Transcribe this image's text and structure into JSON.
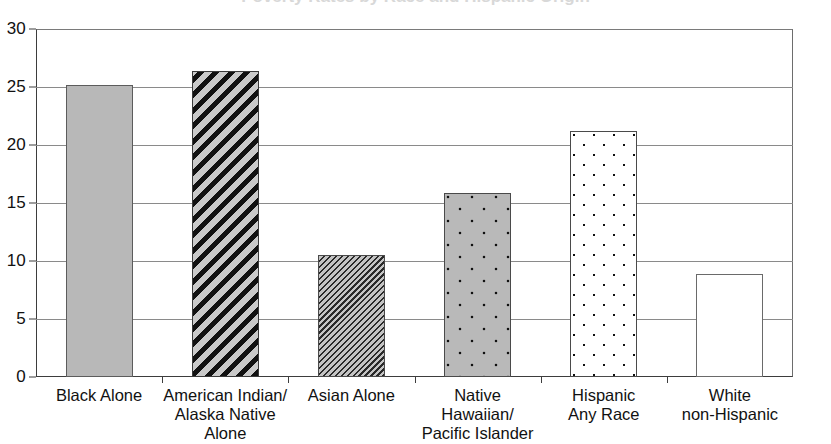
{
  "chart_data": {
    "type": "bar",
    "title": "Poverty Rates by Race and Hispanic Origin",
    "xlabel": "",
    "ylabel": "",
    "ylim": [
      0,
      30
    ],
    "ytick_values": [
      0,
      5,
      10,
      15,
      20,
      25,
      30
    ],
    "ytick_labels": [
      "0",
      "5",
      "10",
      "15",
      "20",
      "25",
      "30"
    ],
    "grid": true,
    "legend": "none",
    "categories": [
      "Black Alone",
      "American Indian/\nAlaska Native\nAlone",
      "Asian Alone",
      "Native\nHawaiian/\nPacific Islander",
      "Hispanic\nAny Race",
      "White\nnon-Hispanic"
    ],
    "values": [
      25.2,
      26.4,
      10.5,
      15.9,
      21.2,
      8.9
    ],
    "bar_patterns": [
      "solid-gray",
      "thick-diagonal-stripes",
      "fine-diagonal-hatch",
      "gray-with-dots",
      "white-with-dots",
      "white-plain"
    ]
  },
  "colors": {
    "axis": "#3d3d3d",
    "gridline": "#8a8a8a",
    "bar_gray": "#b8b8b8",
    "bar_pattern_dark": "#111111",
    "background": "#ffffff"
  }
}
